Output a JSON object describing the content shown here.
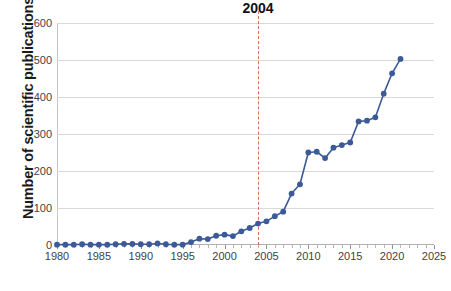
{
  "chart_data": {
    "type": "line",
    "title": "",
    "xlabel": "",
    "ylabel": "Number of scientific publications",
    "xlim": [
      1980,
      2025
    ],
    "ylim": [
      0,
      600
    ],
    "xticks": [
      1980,
      1985,
      1990,
      1995,
      2000,
      2005,
      2010,
      2015,
      2020,
      2025
    ],
    "yticks": [
      0,
      100,
      200,
      300,
      400,
      500,
      600
    ],
    "grid": "horizontal",
    "legend": "none",
    "marker": "circle",
    "series_color": "#3c5998",
    "annotation_color": "#d2705a",
    "x": [
      1980,
      1981,
      1982,
      1983,
      1984,
      1985,
      1986,
      1987,
      1988,
      1989,
      1990,
      1991,
      1992,
      1993,
      1994,
      1995,
      1996,
      1997,
      1998,
      1999,
      2000,
      2001,
      2002,
      2003,
      2004,
      2005,
      2006,
      2007,
      2008,
      2009,
      2010,
      2011,
      2012,
      2013,
      2014,
      2015,
      2016,
      2017,
      2018,
      2019,
      2020,
      2021
    ],
    "values": [
      1,
      1,
      1,
      2,
      1,
      1,
      1,
      2,
      3,
      3,
      2,
      2,
      4,
      2,
      1,
      1,
      8,
      17,
      16,
      25,
      28,
      24,
      37,
      46,
      58,
      64,
      78,
      90,
      139,
      164,
      250,
      252,
      235,
      263,
      270,
      277,
      334,
      336,
      345,
      409,
      464,
      503
    ],
    "annotations": [
      {
        "name": "year-2004-marker",
        "label": "2004",
        "x": 2004,
        "style": "vertical-dashed-line"
      }
    ]
  }
}
